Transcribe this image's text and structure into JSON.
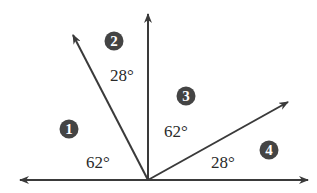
{
  "diagram": {
    "vertex": {
      "x": 148,
      "y": 180
    },
    "colors": {
      "line": "#3a3a3a",
      "badge": "#444444",
      "badge_text": "#ffffff",
      "label": "#2a2a2a"
    },
    "rays": [
      {
        "name": "left-horizontal-ray",
        "tip": {
          "x": 20,
          "y": 180
        }
      },
      {
        "name": "right-horizontal-ray",
        "tip": {
          "x": 308,
          "y": 180
        }
      },
      {
        "name": "vertical-ray",
        "tip": {
          "x": 148,
          "y": 14
        }
      },
      {
        "name": "left-slanted-ray",
        "tip": {
          "x": 73,
          "y": 35
        }
      },
      {
        "name": "right-slanted-ray",
        "tip": {
          "x": 288,
          "y": 102
        }
      }
    ],
    "angles": [
      {
        "id": "1",
        "badge": "1",
        "label": "62°",
        "badge_pos": {
          "x": 69,
          "y": 129
        },
        "label_pos": {
          "x": 86,
          "y": 168
        }
      },
      {
        "id": "2",
        "badge": "2",
        "label": "28°",
        "badge_pos": {
          "x": 114,
          "y": 41
        },
        "label_pos": {
          "x": 110,
          "y": 81
        }
      },
      {
        "id": "3",
        "badge": "3",
        "label": "62°",
        "badge_pos": {
          "x": 186,
          "y": 96
        },
        "label_pos": {
          "x": 164,
          "y": 137
        }
      },
      {
        "id": "4",
        "badge": "4",
        "label": "28°",
        "badge_pos": {
          "x": 269,
          "y": 150
        },
        "label_pos": {
          "x": 211,
          "y": 168
        }
      }
    ]
  }
}
